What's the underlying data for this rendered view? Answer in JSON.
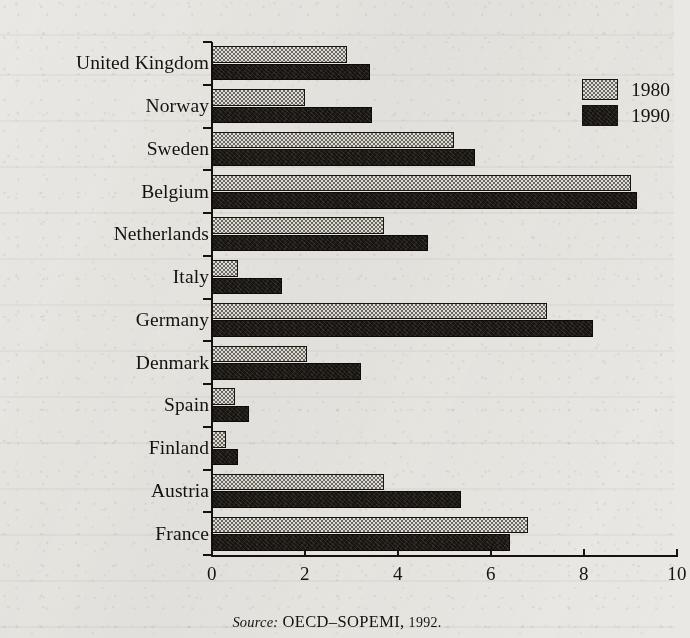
{
  "figure": {
    "background_color": "#e9e8e4",
    "ink_color": "#17130f"
  },
  "legend": {
    "position": "top-right",
    "entries": [
      {
        "label": "1980",
        "swatch": "light-stipple-swatch",
        "color": "#d9d7d2"
      },
      {
        "label": "1990",
        "swatch": "dark-solid-swatch",
        "color": "#17130f"
      }
    ]
  },
  "axis": {
    "x_ticks": [
      "0",
      "2",
      "4",
      "6",
      "8",
      "10"
    ],
    "x_min": 0,
    "x_max": 10
  },
  "caption": {
    "source_word": "Source:",
    "source_body": "OECD–SOPEMI,",
    "source_year": "1992."
  },
  "chart_data": {
    "type": "bar",
    "orientation": "horizontal",
    "title": "",
    "subtitle": "",
    "xlabel": "",
    "ylabel": "",
    "xlim": [
      0,
      10
    ],
    "ylim": null,
    "grid": false,
    "legend_position": "top-right",
    "tick_labels_x": [
      "0",
      "2",
      "4",
      "6",
      "8",
      "10"
    ],
    "categories": [
      "United Kingdom",
      "Norway",
      "Sweden",
      "Belgium",
      "Netherlands",
      "Italy",
      "Germany",
      "Denmark",
      "Spain",
      "Finland",
      "Austria",
      "France"
    ],
    "series": [
      {
        "name": "1980",
        "color": "#d9d7d2",
        "values": [
          2.9,
          2.0,
          5.2,
          9.0,
          3.7,
          0.55,
          7.2,
          2.05,
          0.5,
          0.3,
          3.7,
          6.8
        ]
      },
      {
        "name": "1990",
        "color": "#17130f",
        "values": [
          3.4,
          3.45,
          5.65,
          9.15,
          4.65,
          1.5,
          8.2,
          3.2,
          0.8,
          0.55,
          5.35,
          6.4
        ]
      }
    ],
    "annotations": [
      "Source: OECD–SOPEMI, 1992."
    ]
  }
}
